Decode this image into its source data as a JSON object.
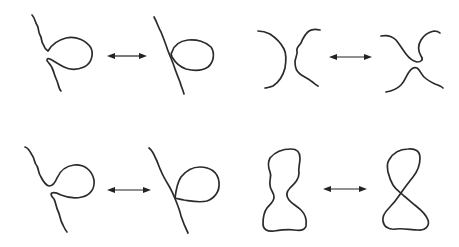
{
  "diagram": {
    "stroke_color": "#2b2b2b",
    "background": "#ffffff",
    "panels": [
      {
        "id": "top-left",
        "left": "strand with a loop not touching the tail (gap)",
        "arrow": "double-headed arrow",
        "right": "strand with loop touching/tangent to a straight strand"
      },
      {
        "id": "top-right",
        "left": "two facing arcs ) (",
        "arrow": "double-headed arrow",
        "right": "two arcs reconnected as upper and lower caps"
      },
      {
        "id": "bottom-left",
        "left": "strand with open loop and gap",
        "arrow": "double-headed arrow",
        "right": "strand with loop crossing at a single point"
      },
      {
        "id": "bottom-right",
        "left": "closed pinched loop (hourglass)",
        "arrow": "double-headed arrow",
        "right": "figure-eight with a single crossing"
      }
    ]
  }
}
